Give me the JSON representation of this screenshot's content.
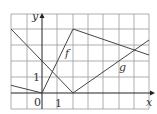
{
  "figure": {
    "axes": {
      "x_label": "x",
      "y_label": "y",
      "origin_label": "0",
      "x_tick_label": "1",
      "y_tick_label": "1"
    },
    "curves": [
      {
        "name": "f",
        "points": [
          [
            -2,
            0.5
          ],
          [
            0,
            0
          ],
          [
            2,
            4
          ],
          [
            7,
            2.5
          ]
        ]
      },
      {
        "name": "g",
        "points": [
          [
            -2,
            4
          ],
          [
            2,
            0
          ],
          [
            7,
            3.4
          ]
        ]
      }
    ],
    "grid": {
      "x_range": [
        -2,
        7
      ],
      "y_range": [
        -1,
        5
      ]
    }
  }
}
